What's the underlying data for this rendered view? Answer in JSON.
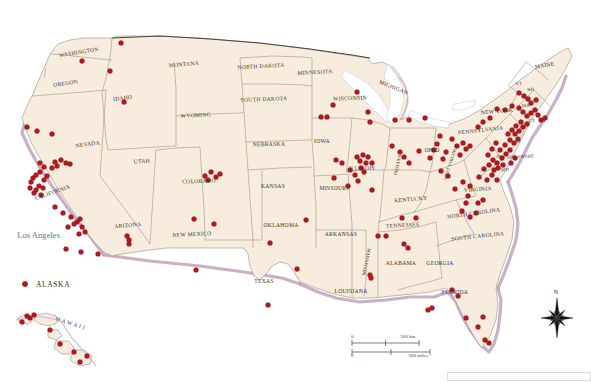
{
  "map": {
    "title": "United States reference map with point locations",
    "projection_note": "contiguous United States with Alaska and Hawaii insets",
    "colors": {
      "land": "#f7ecdd",
      "state_border": "#8d8478",
      "national_border": "#4a443e",
      "coastal_shelf": "#bfa2bb",
      "water": "#ffffff",
      "point_marker": "#b0191d",
      "state_label_text": "#3b332c",
      "city_label_text": "#6a7388"
    },
    "state_labels": [
      {
        "name": "WASHINGTON",
        "x": 79,
        "y": 54,
        "size": "sm",
        "rotate": -9
      },
      {
        "name": "OREGON",
        "x": 66,
        "y": 85,
        "size": "sm",
        "rotate": -9
      },
      {
        "name": "IDAHO",
        "x": 123,
        "y": 100,
        "size": "sm",
        "rotate": -8
      },
      {
        "name": "MONTANA",
        "x": 184,
        "y": 66,
        "size": "sm",
        "rotate": -5
      },
      {
        "name": "WYOMING",
        "x": 196,
        "y": 117,
        "size": "sm",
        "rotate": -3
      },
      {
        "name": "NORTH DAKOTA",
        "x": 261,
        "y": 68,
        "size": "sm",
        "rotate": -3
      },
      {
        "name": "SOUTH DAKOTA",
        "x": 264,
        "y": 101,
        "size": "sm",
        "rotate": -2
      },
      {
        "name": "NEBRASKA",
        "x": 269,
        "y": 146,
        "size": "sm",
        "rotate": -1
      },
      {
        "name": "MINNESOTA",
        "x": 315,
        "y": 74,
        "size": "sm",
        "rotate": -3
      },
      {
        "name": "WISCONSIN",
        "x": 350,
        "y": 100,
        "size": "sm",
        "rotate": -2
      },
      {
        "name": "IOWA",
        "x": 322,
        "y": 143,
        "size": "sm",
        "rotate": 0
      },
      {
        "name": "NEVADA",
        "x": 88,
        "y": 146,
        "size": "sm",
        "rotate": -8
      },
      {
        "name": "UTAH",
        "x": 142,
        "y": 163,
        "size": "sm",
        "rotate": -4
      },
      {
        "name": "COLORADO",
        "x": 199,
        "y": 183,
        "size": "sm",
        "rotate": -2
      },
      {
        "name": "KANSAS",
        "x": 273,
        "y": 188,
        "size": "sm",
        "rotate": 0
      },
      {
        "name": "MISSOURI",
        "x": 334,
        "y": 190,
        "size": "sm",
        "rotate": 0
      },
      {
        "name": "CALIFORNIA",
        "x": 53,
        "y": 194,
        "size": "sm",
        "rotate": -20
      },
      {
        "name": "ARIZONA",
        "x": 128,
        "y": 227,
        "size": "sm",
        "rotate": -5
      },
      {
        "name": "NEW MEXICO",
        "x": 192,
        "y": 236,
        "size": "sm",
        "rotate": -3
      },
      {
        "name": "OKLAHOMA",
        "x": 281,
        "y": 227,
        "size": "sm",
        "rotate": 0
      },
      {
        "name": "TEXAS",
        "x": 264,
        "y": 283,
        "size": "sm",
        "rotate": 0
      },
      {
        "name": "ARKANSAS",
        "x": 341,
        "y": 236,
        "size": "sm",
        "rotate": 0
      },
      {
        "name": "LOUISIANA",
        "x": 351,
        "y": 293,
        "size": "sm",
        "rotate": 0
      },
      {
        "name": "MISSISSIPPI",
        "x": 368,
        "y": 262,
        "size": "xs",
        "rotate": -78
      },
      {
        "name": "ALABAMA",
        "x": 401,
        "y": 265,
        "size": "sm",
        "rotate": 0
      },
      {
        "name": "GEORGIA",
        "x": 440,
        "y": 265,
        "size": "sm",
        "rotate": 0
      },
      {
        "name": "FLORIDA",
        "x": 455,
        "y": 294,
        "size": "sm",
        "rotate": 0
      },
      {
        "name": "TENNESSEE",
        "x": 403,
        "y": 227,
        "size": "sm",
        "rotate": -3
      },
      {
        "name": "KENTUCKY",
        "x": 411,
        "y": 201,
        "size": "sm",
        "rotate": -5
      },
      {
        "name": "ILLINOIS",
        "x": 362,
        "y": 170,
        "size": "sm",
        "rotate": -2
      },
      {
        "name": "INDIANA",
        "x": 399,
        "y": 165,
        "size": "xs",
        "rotate": -78
      },
      {
        "name": "OHIO",
        "x": 432,
        "y": 152,
        "size": "sm",
        "rotate": 0
      },
      {
        "name": "MICHIGAN",
        "x": 393,
        "y": 89,
        "size": "sm",
        "rotate": 22
      },
      {
        "name": "WEST VIRGINIA",
        "x": 452,
        "y": 163,
        "size": "xs",
        "rotate": -72
      },
      {
        "name": "VIRGINIA",
        "x": 478,
        "y": 191,
        "size": "sm",
        "rotate": -4
      },
      {
        "name": "NORTH CAROLINA",
        "x": 474,
        "y": 215,
        "size": "sm",
        "rotate": -8
      },
      {
        "name": "SOUTH CAROLINA",
        "x": 478,
        "y": 238,
        "size": "sm",
        "rotate": -6
      },
      {
        "name": "PENNSYLVANIA",
        "x": 481,
        "y": 132,
        "size": "sm",
        "rotate": -6
      },
      {
        "name": "NEW YORK",
        "x": 497,
        "y": 113,
        "size": "sm",
        "rotate": -5
      },
      {
        "name": "MAINE",
        "x": 545,
        "y": 67,
        "size": "sm",
        "rotate": -10
      },
      {
        "name": "DELAWARE",
        "x": 521,
        "y": 158,
        "size": "xs",
        "rotate": -3
      },
      {
        "name": "VT",
        "x": 519,
        "y": 85,
        "size": "xs",
        "rotate": -8
      },
      {
        "name": "NH",
        "x": 531,
        "y": 91,
        "size": "xs",
        "rotate": -8
      },
      {
        "name": "MA",
        "x": 526,
        "y": 107,
        "size": "xs",
        "rotate": -5
      },
      {
        "name": "CT",
        "x": 532,
        "y": 122,
        "size": "xs",
        "rotate": -3
      },
      {
        "name": "RI",
        "x": 543,
        "y": 122,
        "size": "xs",
        "rotate": -3
      },
      {
        "name": "NJ",
        "x": 518,
        "y": 143,
        "size": "xs",
        "rotate": -4
      },
      {
        "name": "MD",
        "x": 505,
        "y": 171,
        "size": "xs",
        "rotate": -2
      },
      {
        "name": "DC",
        "x": 500,
        "y": 158,
        "size": "xs",
        "rotate": -2
      },
      {
        "name": "H A W A I I",
        "x": 70,
        "y": 325,
        "size": "sm",
        "rotate": 18
      }
    ],
    "city_labels": [
      {
        "name": "Los Angeles",
        "x": 60,
        "y": 238
      }
    ],
    "legend": {
      "items": [
        {
          "label": "ALASKA",
          "marker_x": 25,
          "marker_y": 284,
          "label_x": 36,
          "label_y": 287
        }
      ]
    },
    "scale_bar": {
      "km_zero": "0",
      "km_max": "300 km",
      "miles_zero": "0",
      "miles_max": "300 miles",
      "x": 352,
      "y": 341,
      "width": 78
    },
    "compass": {
      "label": "N",
      "x": 557,
      "y": 318
    },
    "points_note": "red circular markers indicating locations",
    "points": [
      [
        121,
        43
      ],
      [
        82,
        61
      ],
      [
        110,
        71
      ],
      [
        124,
        102
      ],
      [
        27,
        127
      ],
      [
        37,
        131
      ],
      [
        52,
        134
      ],
      [
        66,
        163
      ],
      [
        57,
        166
      ],
      [
        52,
        168
      ],
      [
        44,
        167
      ],
      [
        40,
        163
      ],
      [
        47,
        176
      ],
      [
        44,
        180
      ],
      [
        40,
        172
      ],
      [
        36,
        175
      ],
      [
        33,
        178
      ],
      [
        39,
        186
      ],
      [
        43,
        188
      ],
      [
        36,
        190
      ],
      [
        31,
        182
      ],
      [
        30,
        188
      ],
      [
        34,
        193
      ],
      [
        41,
        195
      ],
      [
        55,
        162
      ],
      [
        61,
        160
      ],
      [
        70,
        164
      ],
      [
        63,
        213
      ],
      [
        55,
        207
      ],
      [
        71,
        217
      ],
      [
        77,
        222
      ],
      [
        80,
        219
      ],
      [
        74,
        224
      ],
      [
        68,
        227
      ],
      [
        82,
        227
      ],
      [
        85,
        232
      ],
      [
        79,
        234
      ],
      [
        66,
        249
      ],
      [
        81,
        252
      ],
      [
        98,
        254
      ],
      [
        129,
        240
      ],
      [
        129,
        244
      ],
      [
        127,
        236
      ],
      [
        194,
        219
      ],
      [
        214,
        224
      ],
      [
        205,
        176
      ],
      [
        211,
        172
      ],
      [
        216,
        177
      ],
      [
        220,
        174
      ],
      [
        208,
        180
      ],
      [
        196,
        270
      ],
      [
        270,
        243
      ],
      [
        268,
        305
      ],
      [
        297,
        269
      ],
      [
        333,
        105
      ],
      [
        321,
        117
      ],
      [
        327,
        117
      ],
      [
        357,
        92
      ],
      [
        368,
        112
      ],
      [
        370,
        122
      ],
      [
        336,
        160
      ],
      [
        342,
        163
      ],
      [
        350,
        170
      ],
      [
        357,
        157
      ],
      [
        363,
        155
      ],
      [
        360,
        161
      ],
      [
        366,
        163
      ],
      [
        355,
        175
      ],
      [
        358,
        181
      ],
      [
        364,
        172
      ],
      [
        372,
        163
      ],
      [
        368,
        157
      ],
      [
        361,
        168
      ],
      [
        348,
        186
      ],
      [
        372,
        190
      ],
      [
        334,
        178
      ],
      [
        395,
        120
      ],
      [
        409,
        120
      ],
      [
        425,
        118
      ],
      [
        392,
        146
      ],
      [
        400,
        152
      ],
      [
        404,
        157
      ],
      [
        409,
        163
      ],
      [
        419,
        151
      ],
      [
        430,
        158
      ],
      [
        434,
        150
      ],
      [
        437,
        144
      ],
      [
        440,
        136
      ],
      [
        443,
        159
      ],
      [
        446,
        152
      ],
      [
        452,
        139
      ],
      [
        457,
        146
      ],
      [
        463,
        143
      ],
      [
        466,
        149
      ],
      [
        460,
        155
      ],
      [
        470,
        146
      ],
      [
        478,
        127
      ],
      [
        483,
        122
      ],
      [
        490,
        118
      ],
      [
        497,
        109
      ],
      [
        505,
        110
      ],
      [
        512,
        106
      ],
      [
        519,
        108
      ],
      [
        523,
        112
      ],
      [
        527,
        116
      ],
      [
        531,
        113
      ],
      [
        535,
        110
      ],
      [
        538,
        115
      ],
      [
        541,
        120
      ],
      [
        545,
        118
      ],
      [
        521,
        122
      ],
      [
        516,
        126
      ],
      [
        512,
        130
      ],
      [
        508,
        134
      ],
      [
        515,
        134
      ],
      [
        519,
        131
      ],
      [
        523,
        127
      ],
      [
        527,
        124
      ],
      [
        510,
        140
      ],
      [
        514,
        143
      ],
      [
        518,
        139
      ],
      [
        505,
        145
      ],
      [
        500,
        150
      ],
      [
        496,
        143
      ],
      [
        492,
        149
      ],
      [
        488,
        155
      ],
      [
        493,
        160
      ],
      [
        497,
        163
      ],
      [
        502,
        158
      ],
      [
        506,
        154
      ],
      [
        510,
        150
      ],
      [
        498,
        168
      ],
      [
        494,
        170
      ],
      [
        503,
        165
      ],
      [
        511,
        163
      ],
      [
        515,
        158
      ],
      [
        489,
        165
      ],
      [
        484,
        169
      ],
      [
        519,
        93
      ],
      [
        524,
        96
      ],
      [
        528,
        99
      ],
      [
        531,
        103
      ],
      [
        536,
        100
      ],
      [
        479,
        177
      ],
      [
        487,
        180
      ],
      [
        492,
        175
      ],
      [
        497,
        180
      ],
      [
        470,
        186
      ],
      [
        463,
        182
      ],
      [
        455,
        189
      ],
      [
        448,
        176
      ],
      [
        441,
        171
      ],
      [
        468,
        196
      ],
      [
        466,
        203
      ],
      [
        478,
        203
      ],
      [
        483,
        200
      ],
      [
        462,
        211
      ],
      [
        470,
        217
      ],
      [
        476,
        213
      ],
      [
        402,
        218
      ],
      [
        416,
        218
      ],
      [
        306,
        220
      ],
      [
        386,
        236
      ],
      [
        378,
        236
      ],
      [
        404,
        244
      ],
      [
        408,
        248
      ],
      [
        370,
        275
      ],
      [
        371,
        278
      ],
      [
        452,
        290
      ],
      [
        458,
        296
      ],
      [
        466,
        318
      ],
      [
        483,
        317
      ],
      [
        478,
        327
      ],
      [
        485,
        340
      ],
      [
        489,
        343
      ],
      [
        432,
        308
      ],
      [
        428,
        310
      ],
      [
        25,
        284
      ],
      [
        30,
        318
      ],
      [
        34,
        315
      ],
      [
        27,
        316
      ],
      [
        50,
        330
      ],
      [
        60,
        344
      ],
      [
        74,
        352
      ],
      [
        87,
        356
      ],
      [
        80,
        362
      ],
      [
        22,
        322
      ]
    ]
  }
}
